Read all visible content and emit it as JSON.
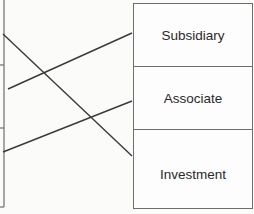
{
  "diagram": {
    "type": "matching-lines",
    "left_column": {
      "items": [
        {
          "label": ""
        },
        {
          "label": ""
        },
        {
          "label": ""
        }
      ]
    },
    "right_column": {
      "items": [
        {
          "label": "Subsidiary"
        },
        {
          "label": "Associate"
        },
        {
          "label": "Investment"
        }
      ]
    },
    "connections": [
      {
        "from": "left-1",
        "to": "Investment"
      },
      {
        "from": "left-2",
        "to": "Subsidiary"
      },
      {
        "from": "left-3",
        "to": "Associate"
      }
    ],
    "colors": {
      "line": "#3a3a3a",
      "border": "#6e6e6e",
      "text": "#2a2a2a",
      "background": "#fbfbfa"
    }
  }
}
